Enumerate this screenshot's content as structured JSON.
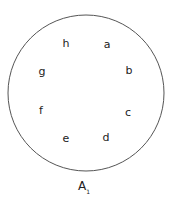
{
  "diagram": {
    "shape": "circle",
    "circle": {
      "cx": 86,
      "cy": 93,
      "r": 78,
      "stroke": "#555555"
    },
    "points": [
      {
        "label": "a",
        "x": 107,
        "y": 44
      },
      {
        "label": "b",
        "x": 129,
        "y": 70
      },
      {
        "label": "c",
        "x": 128,
        "y": 112
      },
      {
        "label": "d",
        "x": 106,
        "y": 137
      },
      {
        "label": "e",
        "x": 66,
        "y": 138
      },
      {
        "label": "f",
        "x": 41,
        "y": 110
      },
      {
        "label": "g",
        "x": 42,
        "y": 71
      },
      {
        "label": "h",
        "x": 66,
        "y": 43
      }
    ],
    "caption": {
      "main": "A",
      "sub": "1"
    }
  }
}
